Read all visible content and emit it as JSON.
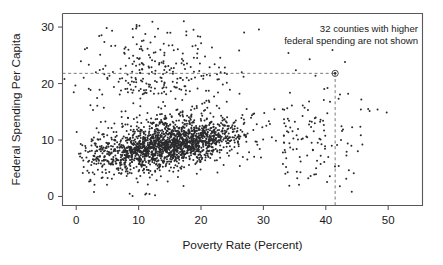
{
  "chart_data": {
    "type": "scatter",
    "title": "",
    "xlabel": "Poverty Rate (Percent)",
    "ylabel": "Federal Spending Per Capita",
    "xlim": [
      -2.2,
      55.5
    ],
    "ylim": [
      -1.6,
      32.4
    ],
    "xticks": [
      0,
      10,
      20,
      30,
      40,
      50
    ],
    "xtick_labels": [
      "0",
      "10",
      "20",
      "30",
      "40",
      "50"
    ],
    "yticks": [
      0,
      10,
      20,
      30
    ],
    "ytick_labels": [
      "0",
      "10",
      "20",
      "30"
    ],
    "grid": false,
    "legend": null,
    "annotations": [
      {
        "name": "excluded-counties-note",
        "line1": "32 counties with higher",
        "line2": "federal spending are not shown",
        "x": 41.5,
        "y": 30.4
      }
    ],
    "reference_lines": [
      {
        "name": "horizontal-reference",
        "orientation": "horizontal",
        "value": 21.8,
        "style": "dashed"
      },
      {
        "name": "vertical-reference",
        "orientation": "vertical",
        "value": 41.5,
        "style": "dashed"
      }
    ],
    "highlight_point": {
      "x": 41.5,
      "y": 21.8,
      "marker": "circled-dot"
    },
    "point_count_visible": 1900,
    "marker": {
      "shape": "circle",
      "size_px": 1.5,
      "color": "#2a2a2c"
    },
    "series": [
      {
        "name": "counties",
        "description": "US counties: poverty rate vs federal spending per capita",
        "cluster_center": [
          15.0,
          9.0
        ],
        "correlation": 0.27,
        "points_summary": {
          "core_x_range": [
            3,
            33
          ],
          "core_y_range": [
            2,
            17
          ],
          "tail_x_range": [
            33,
            55
          ],
          "upper_band_y_range": [
            17,
            32
          ]
        }
      }
    ],
    "colors": {
      "point": "#2a2a2c",
      "frame": "#58585a",
      "text": "#1a1a1a",
      "reference": "#6b6b6e",
      "background": "#ffffff"
    }
  }
}
